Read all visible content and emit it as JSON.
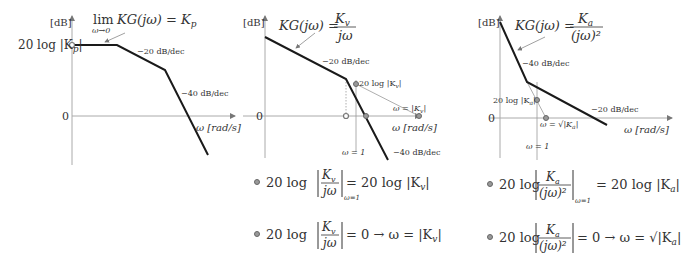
{
  "common": {
    "y_unit": "[dB]",
    "x_axis_label": "ω [rad/s]",
    "zero_label": "0"
  },
  "plots": [
    {
      "id": "type0",
      "formula_lim": "lim",
      "formula_lim_sub": "ω→0",
      "formula": "KG(jω) = K",
      "formula_sub": "p",
      "y_intercept_label": "20 log |K",
      "y_intercept_sub": "p",
      "slope1": "−20 dB/dec",
      "slope2": "−40 dB/dec"
    },
    {
      "id": "type1",
      "formula_lhs": "KG(jω) =",
      "formula_num": "K",
      "formula_num_sub": "v",
      "formula_den": "jω",
      "slope1": "−20 dB/dec",
      "slope2": "−40 dB/dec",
      "point_label": "20 log |K",
      "point_label_sub": "v",
      "crossing_label": "ω = |K",
      "crossing_label_sub": "v",
      "omega1_label": "ω = 1",
      "equations": [
        {
          "lhs": "20 log",
          "num": "K",
          "num_sub": "v",
          "den": "jω",
          "eval": "ω=1",
          "rhs": "= 20 log |K",
          "rhs_sub": "v"
        },
        {
          "lhs": "20 log",
          "num": "K",
          "num_sub": "v",
          "den": "jω",
          "rhs": "= 0 → ω = |K",
          "rhs_sub": "v"
        }
      ]
    },
    {
      "id": "type2",
      "formula_lhs": "KG(jω) =",
      "formula_num": "K",
      "formula_num_sub": "a",
      "formula_den": "(jω)²",
      "slope1": "−40 dB/dec",
      "slope2": "−20 dB/dec",
      "point_label": "20 log |K",
      "point_label_sub": "a",
      "crossing_label": "ω = √|K",
      "crossing_label_sub": "a",
      "omega1_label": "ω = 1",
      "equations": [
        {
          "lhs": "20 log",
          "num": "K",
          "num_sub": "a",
          "den": "(jω)²",
          "eval": "ω=1",
          "rhs": "= 20 log |K",
          "rhs_sub": "a"
        },
        {
          "lhs": "20 log",
          "num": "K",
          "num_sub": "a",
          "den": "(jω)²",
          "rhs": "= 0 → ω = √|K",
          "rhs_sub": "a"
        }
      ]
    }
  ]
}
